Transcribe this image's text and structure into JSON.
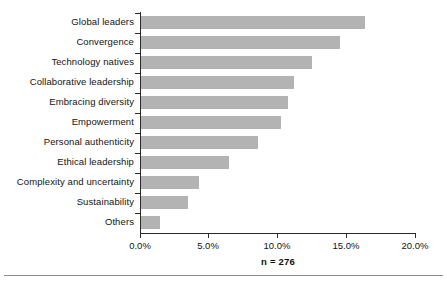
{
  "chart_data": {
    "type": "bar",
    "orientation": "horizontal",
    "title": "",
    "subtitle": "",
    "xlabel": "",
    "ylabel": "",
    "categories": [
      "Global leaders",
      "Convergence",
      "Technology natives",
      "Collaborative leadership",
      "Embracing diversity",
      "Empowerment",
      "Personal authenticity",
      "Ethical leadership",
      "Complexity and uncertainty",
      "Sustainability",
      "Others"
    ],
    "values": [
      16.3,
      14.5,
      12.4,
      11.1,
      10.7,
      10.2,
      8.5,
      6.4,
      4.2,
      3.4,
      1.4
    ],
    "value_unit": "%",
    "xlim": [
      0,
      20
    ],
    "xticks": [
      0,
      5,
      10,
      15,
      20
    ],
    "xtick_labels": [
      "0.0%",
      "5.0%",
      "10.0%",
      "15.0%",
      "20.0%"
    ],
    "grid": false,
    "legend": null,
    "annotation": "n = 276",
    "bar_color": "#b3b3b3",
    "axis_color": "#2b2b2b",
    "text_color": "#131313"
  },
  "figure": {
    "footnote": "n = 276"
  }
}
